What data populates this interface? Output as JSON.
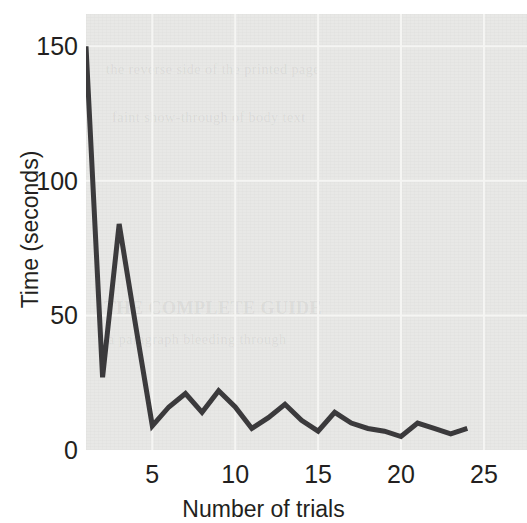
{
  "chart_data": {
    "type": "line",
    "title": "",
    "subtitle": "",
    "xlabel": "Number of trials",
    "ylabel": "Time (seconds)",
    "xlim": [
      1,
      27.6
    ],
    "ylim": [
      0,
      162
    ],
    "xticks": [
      5,
      10,
      15,
      20,
      25
    ],
    "yticks": [
      0,
      50,
      100,
      150
    ],
    "xtick_labels": [
      "5",
      "10",
      "15",
      "20",
      "25"
    ],
    "ytick_labels": [
      "0",
      "50",
      "100",
      "150"
    ],
    "grid": true,
    "grid_color": "#f5f5f3",
    "legend": null,
    "legend_position": "none",
    "line_color": "#3b3a3c",
    "line_width": 5,
    "panel_background": "#e8e8e6",
    "page_background": "#ffffff",
    "text_color": "#231f20",
    "series": [
      {
        "name": "Time per trial",
        "x": [
          1,
          2,
          3,
          4,
          5,
          6,
          7,
          8,
          9,
          10,
          11,
          12,
          13,
          14,
          15,
          16,
          17,
          18,
          19,
          20,
          21,
          22,
          23,
          24
        ],
        "values": [
          150,
          27,
          84,
          46,
          9,
          16,
          21,
          14,
          22,
          16,
          8,
          12,
          17,
          11,
          7,
          14,
          10,
          8,
          7,
          5,
          10,
          8,
          6,
          8
        ]
      }
    ],
    "annotations": []
  },
  "figure": {
    "ghost_text_lines": [
      "the reverse side of the printed page",
      "faint show-through of body text",
      "THE COMPLETE GUIDE",
      "a paragraph bleeding through"
    ]
  }
}
